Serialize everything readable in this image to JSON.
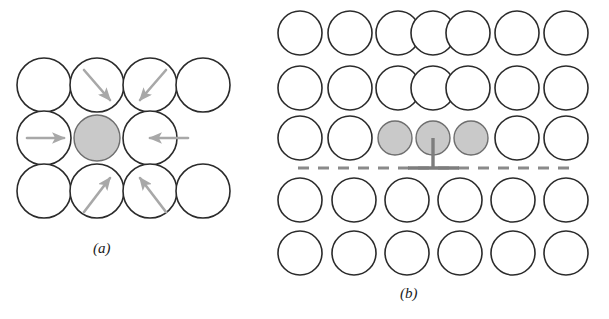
{
  "figure": {
    "width": 609,
    "height": 319,
    "background": "#ffffff",
    "caption_a": "(a)",
    "caption_b": "(b)"
  },
  "style": {
    "circle_stroke": "#2b2b2b",
    "circle_fill_white": "#ffffff",
    "circle_fill_gray": "#c9c9c9",
    "gray_circle_stroke": "#6e6e6e",
    "arrow_color": "#a8a8a8",
    "slip_plane_color": "#8a8a8a",
    "dislocation_symbol_color": "#7d7d7d",
    "stroke_width": 1.6,
    "gray_stroke_width": 1.4
  },
  "panel_a": {
    "name": "lattice-strain-around-impurity-atom",
    "circle_radius": 27,
    "small_circle_radius": 23,
    "rows": [
      {
        "row_index": 0,
        "cy": 85,
        "circles": [
          {
            "cx": 44,
            "fill": "white",
            "arrow": null
          },
          {
            "cx": 97,
            "fill": "white",
            "arrow": "down-right"
          },
          {
            "cx": 150,
            "fill": "white",
            "arrow": "down-left"
          },
          {
            "cx": 203,
            "fill": "white",
            "arrow": null
          }
        ]
      },
      {
        "row_index": 1,
        "cy": 138,
        "circles": [
          {
            "cx": 44,
            "fill": "white",
            "arrow": "right"
          },
          {
            "cx": 97,
            "fill": "gray",
            "arrow": null
          },
          {
            "cx": 150,
            "fill": "white",
            "arrow": "left"
          }
        ]
      },
      {
        "row_index": 2,
        "cy": 191,
        "circles": [
          {
            "cx": 44,
            "fill": "white",
            "arrow": null
          },
          {
            "cx": 97,
            "fill": "white",
            "arrow": "up-right"
          },
          {
            "cx": 150,
            "fill": "white",
            "arrow": "up-left"
          },
          {
            "cx": 203,
            "fill": "white",
            "arrow": null
          }
        ]
      }
    ],
    "arrows": [
      {
        "id": "arrow-top-left",
        "x1": 84,
        "y1": 70,
        "x2": 110,
        "y2": 100,
        "direction": "down-right"
      },
      {
        "id": "arrow-top-right",
        "x1": 166,
        "y1": 70,
        "x2": 140,
        "y2": 100,
        "direction": "down-left"
      },
      {
        "id": "arrow-middle-left",
        "x1": 27,
        "y1": 138,
        "x2": 64,
        "y2": 138,
        "direction": "right"
      },
      {
        "id": "arrow-middle-right",
        "x1": 188,
        "y1": 138,
        "x2": 150,
        "y2": 138,
        "direction": "left"
      },
      {
        "id": "arrow-bottom-left",
        "x1": 84,
        "y1": 212,
        "x2": 110,
        "y2": 178,
        "direction": "up-right"
      },
      {
        "id": "arrow-bottom-right",
        "x1": 166,
        "y1": 212,
        "x2": 140,
        "y2": 178,
        "direction": "up-left"
      }
    ]
  },
  "panel_b": {
    "name": "edge-dislocation-with-solute-atoms",
    "circle_radius": 22,
    "small_circle_radius": 17,
    "rows": [
      {
        "row_index": 0,
        "cy": 33,
        "circles": [
          {
            "cx": 300,
            "fill": "white",
            "r": 22
          },
          {
            "cx": 350,
            "fill": "white",
            "r": 22
          },
          {
            "cx": 398,
            "fill": "white",
            "r": 22
          },
          {
            "cx": 433,
            "fill": "white",
            "r": 22
          },
          {
            "cx": 468,
            "fill": "white",
            "r": 22
          },
          {
            "cx": 517,
            "fill": "white",
            "r": 22
          },
          {
            "cx": 566,
            "fill": "white",
            "r": 22
          }
        ]
      },
      {
        "row_index": 1,
        "cy": 88,
        "circles": [
          {
            "cx": 300,
            "fill": "white",
            "r": 22
          },
          {
            "cx": 350,
            "fill": "white",
            "r": 22
          },
          {
            "cx": 398,
            "fill": "white",
            "r": 22
          },
          {
            "cx": 433,
            "fill": "white",
            "r": 22
          },
          {
            "cx": 468,
            "fill": "white",
            "r": 22
          },
          {
            "cx": 517,
            "fill": "white",
            "r": 22
          },
          {
            "cx": 566,
            "fill": "white",
            "r": 22
          }
        ]
      },
      {
        "row_index": 2,
        "cy": 138,
        "circles": [
          {
            "cx": 300,
            "fill": "white",
            "r": 22
          },
          {
            "cx": 350,
            "fill": "white",
            "r": 22
          },
          {
            "cx": 395,
            "fill": "gray",
            "r": 17
          },
          {
            "cx": 433,
            "fill": "gray",
            "r": 17
          },
          {
            "cx": 471,
            "fill": "gray",
            "r": 17
          },
          {
            "cx": 517,
            "fill": "white",
            "r": 22
          },
          {
            "cx": 566,
            "fill": "white",
            "r": 22
          }
        ]
      },
      {
        "row_index": 3,
        "cy": 200,
        "circles": [
          {
            "cx": 300,
            "fill": "white",
            "r": 22
          },
          {
            "cx": 354,
            "fill": "white",
            "r": 22
          },
          {
            "cx": 407,
            "fill": "white",
            "r": 22
          },
          {
            "cx": 460,
            "fill": "white",
            "r": 22
          },
          {
            "cx": 513,
            "fill": "white",
            "r": 22
          },
          {
            "cx": 566,
            "fill": "white",
            "r": 22
          }
        ]
      },
      {
        "row_index": 4,
        "cy": 253,
        "circles": [
          {
            "cx": 300,
            "fill": "white",
            "r": 22
          },
          {
            "cx": 354,
            "fill": "white",
            "r": 22
          },
          {
            "cx": 407,
            "fill": "white",
            "r": 22
          },
          {
            "cx": 460,
            "fill": "white",
            "r": 22
          },
          {
            "cx": 513,
            "fill": "white",
            "r": 22
          },
          {
            "cx": 566,
            "fill": "white",
            "r": 22
          }
        ]
      }
    ],
    "slip_plane": {
      "id": "slip-plane-dashed-line",
      "x1": 298,
      "x2": 578,
      "y": 168,
      "dash": "11 9",
      "width": 3.2
    },
    "dislocation_symbol": {
      "id": "dislocation-perpendicular-symbol",
      "glyph": "perpendicular",
      "stem_x": 433,
      "stem_y_top": 138,
      "stem_y_bottom": 168,
      "bar_x1": 408,
      "bar_x2": 459,
      "bar_y": 168,
      "width": 3.4
    }
  }
}
